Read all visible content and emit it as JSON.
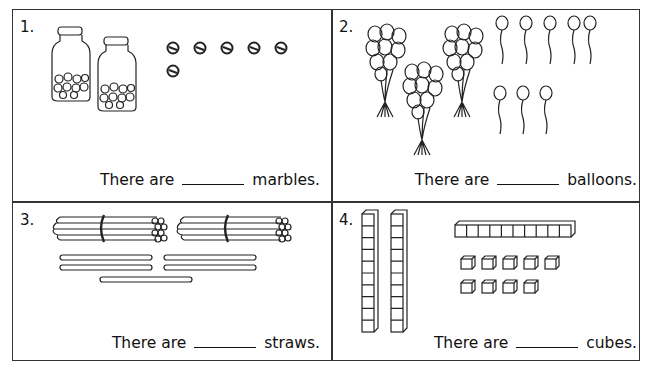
{
  "worksheet": {
    "problems": [
      {
        "number": "1.",
        "prefix": "There are",
        "suffix": "marbles.",
        "illustration": "two-jars-of-marbles-plus-loose-marbles",
        "groups_of_ten": 2,
        "loose_items": 6
      },
      {
        "number": "2.",
        "prefix": "There are",
        "suffix": "balloons.",
        "illustration": "balloon-bunches-plus-single-balloons",
        "groups_of_ten": 3,
        "loose_items": 8
      },
      {
        "number": "3.",
        "prefix": "There are",
        "suffix": "straws.",
        "illustration": "straw-bundles-plus-loose-straws",
        "groups_of_ten": 2,
        "loose_items": 5
      },
      {
        "number": "4.",
        "prefix": "There are",
        "suffix": "cubes.",
        "illustration": "base-ten-rods-and-unit-cubes",
        "vertical_rods": 2,
        "horizontal_rods": 1,
        "loose_items": 9
      }
    ]
  }
}
